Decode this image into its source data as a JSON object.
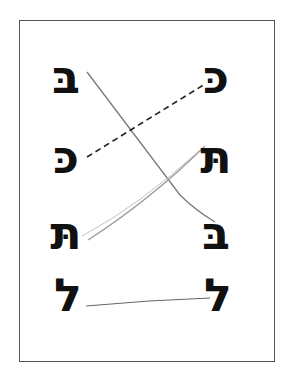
{
  "worksheet": {
    "task": "match identical Hebrew letters",
    "left_column": [
      {
        "letter": "בּ",
        "name": "bet with dagesh"
      },
      {
        "letter": "כּ",
        "name": "kaf with dagesh"
      },
      {
        "letter": "תּ",
        "name": "tav with dagesh"
      },
      {
        "letter": "ל",
        "name": "lamed"
      }
    ],
    "right_column": [
      {
        "letter": "כּ",
        "name": "kaf with dagesh"
      },
      {
        "letter": "תּ",
        "name": "tav with dagesh"
      },
      {
        "letter": "בּ",
        "name": "bet with dagesh"
      },
      {
        "letter": "ל",
        "name": "lamed"
      }
    ],
    "matches": [
      {
        "from": "left-1",
        "to": "right-3",
        "style": "solid",
        "color": "#7a7a7a"
      },
      {
        "from": "left-2",
        "to": "right-1",
        "style": "dashed",
        "color": "#222222"
      },
      {
        "from": "left-3",
        "to": "right-2",
        "style": "solid",
        "color": "#9a9a9a"
      },
      {
        "from": "left-4",
        "to": "right-4",
        "style": "solid",
        "color": "#666666"
      }
    ]
  }
}
